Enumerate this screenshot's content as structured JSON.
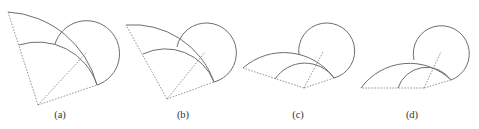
{
  "figure": {
    "panels": [
      {
        "id": "a",
        "label": "(a)"
      },
      {
        "id": "b",
        "label": "(b)"
      },
      {
        "id": "c",
        "label": "(c)"
      },
      {
        "id": "d",
        "label": "(d)"
      }
    ]
  },
  "style": {
    "line_color": "#6e6e6e",
    "dashed_color": "#8a8a8a",
    "background": "#ffffff"
  }
}
